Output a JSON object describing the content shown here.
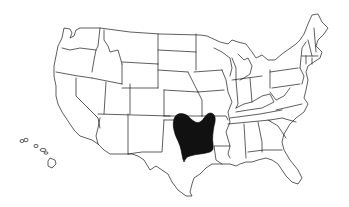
{
  "map": {
    "type": "outline-map",
    "region": "United States (lower 48 + Hawaii inset)",
    "style": "black-and-white state outlines",
    "colors": {
      "background": "#ffffff",
      "outline": "#1a1a1a",
      "highlight": "#111111"
    },
    "highlighted_area": {
      "description": "Shaded region centered on eastern Oklahoma, northeast Texas, western Arkansas and northwest Louisiana",
      "fill": "#111111",
      "states_touched": [
        "Oklahoma",
        "Texas",
        "Arkansas",
        "Louisiana"
      ]
    },
    "insets": [
      "Hawaii"
    ],
    "labels": []
  }
}
